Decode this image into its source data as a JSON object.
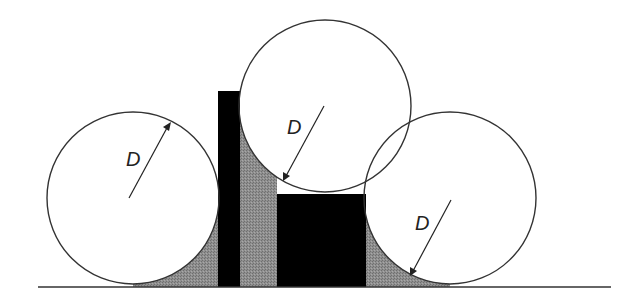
{
  "diagram": {
    "colors": {
      "line": "#333333",
      "solid": "#000000",
      "fill_gray": "#8c8c8c",
      "background": "#ffffff"
    },
    "labels": {
      "circle_left": "D",
      "circle_middle": "D",
      "circle_right": "D"
    },
    "elements": {
      "circles": [
        {
          "name": "left-circle",
          "cx": 133,
          "cy": 198,
          "r": 86
        },
        {
          "name": "middle-circle",
          "cx": 325,
          "cy": 106,
          "r": 86
        },
        {
          "name": "right-circle",
          "cx": 450,
          "cy": 198,
          "r": 86
        }
      ],
      "blocks": [
        {
          "name": "tall-bar",
          "x": 218,
          "y": 91,
          "w": 22,
          "h": 196
        },
        {
          "name": "short-block",
          "x": 277,
          "y": 194,
          "w": 89,
          "h": 93
        }
      ],
      "baseline": {
        "x1": 38,
        "x2": 611,
        "y": 287
      }
    }
  }
}
